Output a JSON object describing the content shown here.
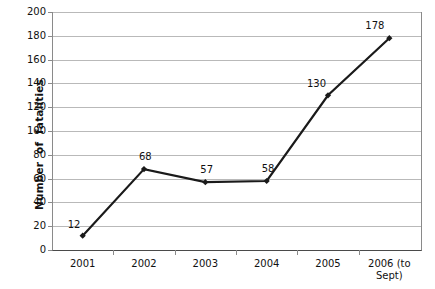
{
  "chart_data": {
    "type": "line",
    "title": "",
    "xlabel": "",
    "ylabel": "Number  of  fatalities",
    "categories": [
      "2001",
      "2002",
      "2003",
      "2004",
      "2005",
      "2006 (to\nSept)"
    ],
    "values": [
      12,
      68,
      57,
      58,
      130,
      178
    ],
    "point_labels": [
      "12",
      "68",
      "57",
      "58",
      "130",
      "178"
    ],
    "ylim": [
      0,
      200
    ],
    "ytick_step": 20,
    "yticks": [
      "200",
      "180",
      "160",
      "140",
      "120",
      "100",
      "80",
      "60",
      "40",
      "20",
      "0"
    ],
    "grid": true,
    "legend": "none",
    "series": [
      {
        "name": "Number of fatalities",
        "values": [
          12,
          68,
          57,
          58,
          130,
          178
        ],
        "line_color": "#1a1a1a",
        "marker": "diamond",
        "marker_color": "#1a1a1a"
      }
    ],
    "colors": {
      "gridline": "#b9b9b9",
      "axis": "#8a8a8a",
      "text": "#111111",
      "background": "#ffffff"
    }
  }
}
